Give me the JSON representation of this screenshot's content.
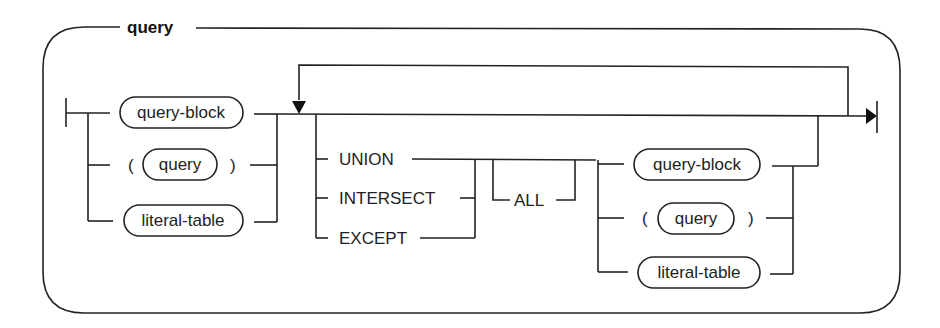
{
  "diagram": {
    "type": "railroad-syntax-diagram",
    "title": "query",
    "colors": {
      "line": "#222222",
      "background": "#ffffff"
    },
    "start_group": {
      "items": [
        {
          "kind": "nonterminal",
          "label": "query-block"
        },
        {
          "kind": "group",
          "open": "(",
          "label": "query",
          "close": ")"
        },
        {
          "kind": "nonterminal",
          "label": "literal-table"
        }
      ]
    },
    "repeat_group": {
      "operators": [
        "UNION",
        "INTERSECT",
        "EXCEPT"
      ],
      "optional": "ALL",
      "items": [
        {
          "kind": "nonterminal",
          "label": "query-block"
        },
        {
          "kind": "group",
          "open": "(",
          "label": "query",
          "close": ")"
        },
        {
          "kind": "nonterminal",
          "label": "literal-table"
        }
      ]
    }
  }
}
